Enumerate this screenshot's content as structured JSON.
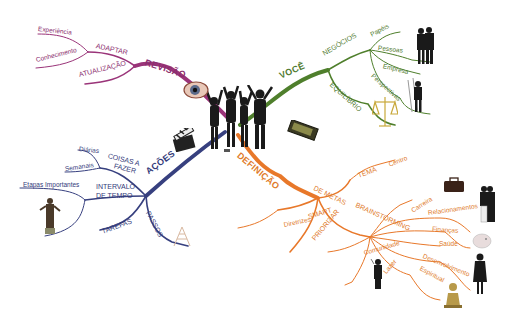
{
  "colors": {
    "revisao": "#9a3479",
    "voce": "#4f7f2c",
    "acoes": "#37407f",
    "definicao": "#e8782a",
    "leaf_line": "#c9b9c2"
  },
  "center": {
    "image": "group-of-people-jumping-icon"
  },
  "branches": {
    "revisao": {
      "label": "REVISÃO",
      "icon": "eye-icon",
      "children": {
        "adaptar": {
          "label": "ADAPTAR",
          "children": [
            "Experiência",
            "Conhecimento"
          ]
        },
        "atualizacao": {
          "label": "ATUALIZAÇÃO"
        }
      }
    },
    "voce": {
      "label": "VOCÊ",
      "children": {
        "negocios": {
          "label": "NEGÓCIOS",
          "children": [
            "Papéis",
            "Pessoas",
            "Empresa",
            "Perspectivas"
          ]
        },
        "equilibrio": {
          "label": "EQUILÍBRIO",
          "icon": "scales-icon"
        }
      }
    },
    "acoes": {
      "label": "AÇÕES",
      "icon": "clapperboard-icon",
      "children": {
        "coisas": {
          "label_line1": "COISAS A",
          "label_line2": "FAZER",
          "children": [
            "Diárias",
            "Semanais"
          ]
        },
        "intervalo": {
          "label_line1": "INTERVALO",
          "label_line2": "DE TEMPO",
          "children": [
            "Etapas Importantes"
          ]
        },
        "tarefas": {
          "label": "TAREFAS"
        },
        "passos": {
          "label": "PASSOS",
          "icon": "ladder-icon"
        }
      }
    },
    "definicao": {
      "label": "DEFINIÇÃO",
      "icon": "gold-bar-icon",
      "children": {
        "metas": {
          "label": "DE METAS",
          "children": {
            "tema": {
              "label": "TEMA",
              "children": [
                "Centro"
              ]
            },
            "brainstorming": {
              "label": "BRAINSTORMING",
              "children": [
                "Carreira",
                "Relacionamentos",
                "Finanças",
                "Saúde",
                "Desenvolvimento",
                "Espiritual",
                "Lazer",
                "Comunidade"
              ]
            },
            "smart": {
              "label": "SMART",
              "children": [
                "Diretrizes"
              ]
            },
            "priorizar": {
              "label": "PRIORIZAR"
            }
          }
        }
      }
    }
  }
}
